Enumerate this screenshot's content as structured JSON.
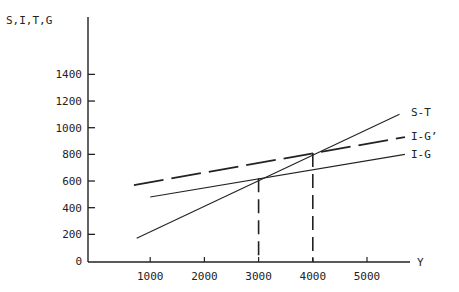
{
  "chart_data": {
    "type": "line",
    "title": "",
    "xlabel": "Y",
    "ylabel": "S,I,T,G",
    "xlim": [
      0,
      6000
    ],
    "ylim": [
      0,
      1500
    ],
    "x_ticks": [
      1000,
      2000,
      3000,
      4000,
      5000
    ],
    "x_tick_labels": [
      "1000",
      "2000",
      "3000",
      "4000",
      "5000"
    ],
    "y_ticks": [
      0,
      200,
      400,
      600,
      800,
      1000,
      1200,
      1400
    ],
    "y_tick_labels": [
      "0",
      "200",
      "400",
      "600",
      "800",
      "1000",
      "1200",
      "1400"
    ],
    "grid": false,
    "legend": "inline labels at right end of lines",
    "series": [
      {
        "name": "S-T",
        "style": "solid",
        "x": [
          750,
          5600
        ],
        "y": [
          170,
          1100
        ]
      },
      {
        "name": "I-G'",
        "style": "dashed-long",
        "x": [
          700,
          5700
        ],
        "y": [
          570,
          930
        ]
      },
      {
        "name": "I-G",
        "style": "solid",
        "x": [
          1000,
          5700
        ],
        "y": [
          480,
          800
        ]
      }
    ],
    "annotations": [
      {
        "type": "vertical-dashed",
        "x": 3000,
        "y_top": 620,
        "note": "S-T intersects I-G at Y=3000"
      },
      {
        "type": "vertical-dashed",
        "x": 4000,
        "y_top": 810,
        "note": "S-T intersects I-G' at Y=4000"
      }
    ]
  },
  "labels": {
    "y_axis": "S,I,T,G",
    "x_axis": "Y",
    "series_st": "S-T",
    "series_igp": "I-G’",
    "series_ig": "I-G"
  }
}
